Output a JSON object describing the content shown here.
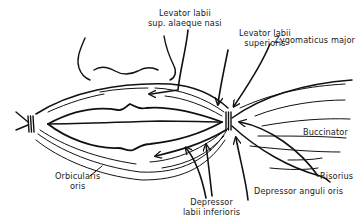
{
  "figure": {
    "ink_color": "#111111",
    "background": "#ffffff"
  },
  "labels": {
    "levator_labii_sup_alaeque_nasi": {
      "line1": "Levator labii",
      "line2": "sup. alaeque nasi"
    },
    "levator_labii_superioris": {
      "line1": "Levator labii",
      "line2": "superioris"
    },
    "zygomaticus_major": {
      "line1": "Zygomaticus major"
    },
    "buccinator": {
      "line1": "Buccinator"
    },
    "risorius": {
      "line1": "Risorius"
    },
    "depressor_anguli_oris": {
      "line1": "Depressor anguli oris"
    },
    "depressor_labii_inferioris": {
      "line1": "Depressor",
      "line2": "labii inferioris"
    },
    "orbicularis_oris": {
      "line1": "Orbicularis",
      "line2": "oris"
    }
  }
}
